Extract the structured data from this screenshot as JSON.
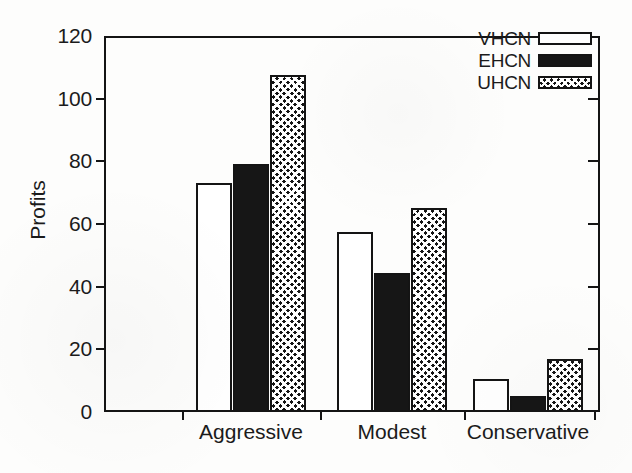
{
  "chart_data": {
    "type": "bar",
    "title": "",
    "xlabel": "",
    "ylabel": "Profits",
    "categories": [
      "Aggressive",
      "Modest",
      "Conservative"
    ],
    "series": [
      {
        "name": "VHCN",
        "fill": "empty",
        "values": [
          73,
          57.5,
          10.5
        ]
      },
      {
        "name": "EHCN",
        "fill": "solid",
        "values": [
          79,
          44.5,
          5
        ]
      },
      {
        "name": "UHCN",
        "fill": "cross",
        "values": [
          107.5,
          65,
          17
        ]
      }
    ],
    "ylim": [
      0,
      120
    ],
    "yticks": [
      0,
      20,
      40,
      60,
      80,
      100,
      120
    ],
    "ytick_labels": [
      "0",
      "20",
      "40",
      "60",
      "80",
      "100",
      "120"
    ],
    "grid": false,
    "legend_position": "top-right",
    "colors": {
      "axis": "#141414",
      "text": "#1b1b1b",
      "bar_empty": "#ffffff",
      "bar_solid": "#161616",
      "bar_cross": "#151515",
      "background": "#ffffff"
    }
  },
  "legend": {
    "entries": [
      {
        "label": "VHCN",
        "fill": "empty"
      },
      {
        "label": "EHCN",
        "fill": "solid"
      },
      {
        "label": "UHCN",
        "fill": "cross"
      }
    ]
  }
}
